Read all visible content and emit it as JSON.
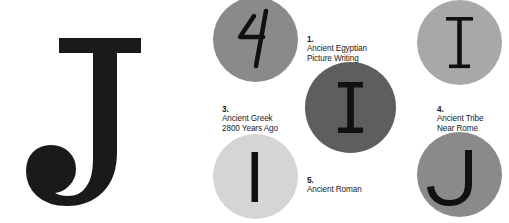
{
  "figure": {
    "background_color": "#ffffff",
    "display_letter": {
      "character": "J",
      "style": "bold slab serif with ball terminal",
      "color": "#1a1a1a"
    },
    "items": [
      {
        "id": "egyptian",
        "number": "1.",
        "label": "Ancient Egyptian\nPicture Writing",
        "glyph": "hieroglyph-hand-stroke",
        "circle_color": "#8a8a8a",
        "glyph_color": "#111111"
      },
      {
        "id": "greek",
        "number": "3.",
        "label": "Ancient Greek\n2800 Years Ago",
        "glyph": "I",
        "circle_color": "#5e5e5e",
        "glyph_color": "#111111"
      },
      {
        "id": "tribe-near-rome",
        "number": "4.",
        "label": "Ancient Tribe\nNear Rome",
        "glyph": "I-barred",
        "circle_color": "#a8a8a8",
        "glyph_color": "#111111"
      },
      {
        "id": "roman",
        "number": "5.",
        "label": "Ancient Roman",
        "glyph": "I-bar",
        "circle_color": "#d5d5d5",
        "glyph_color": "#111111"
      },
      {
        "id": "modern",
        "number": "",
        "label": "",
        "glyph": "J",
        "circle_color": "#8a8a8a",
        "glyph_color": "#111111"
      }
    ]
  }
}
